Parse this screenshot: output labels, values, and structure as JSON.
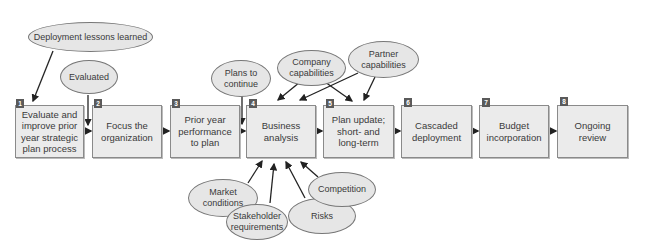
{
  "diagram": {
    "steps": [
      {
        "num": "1",
        "label": "Evaluate and improve prior year strategic plan process"
      },
      {
        "num": "2",
        "label": "Focus the organization"
      },
      {
        "num": "3",
        "label": "Prior year performance to plan"
      },
      {
        "num": "4",
        "label": "Business analysis"
      },
      {
        "num": "5",
        "label": "Plan update; short- and long-term"
      },
      {
        "num": "6",
        "label": "Cascaded deployment"
      },
      {
        "num": "7",
        "label": "Budget incorporation"
      },
      {
        "num": "8",
        "label": "Ongoing review"
      }
    ],
    "inputs": {
      "deployment_lessons": "Deployment lessons learned",
      "evaluated": "Evaluated",
      "plans_to_continue": "Plans to continue",
      "company_capabilities": "Company capabilities",
      "partner_capabilities": "Partner capabilities",
      "market_conditions": "Market conditions",
      "stakeholder_requirements": "Stakeholder requirements",
      "risks": "Risks",
      "competition": "Competition"
    },
    "colors": {
      "box_fill": "#ebebeb",
      "ellipse_fill": "#e6e6e6",
      "badge": "#5a5a5a",
      "arrow": "#222222"
    }
  }
}
